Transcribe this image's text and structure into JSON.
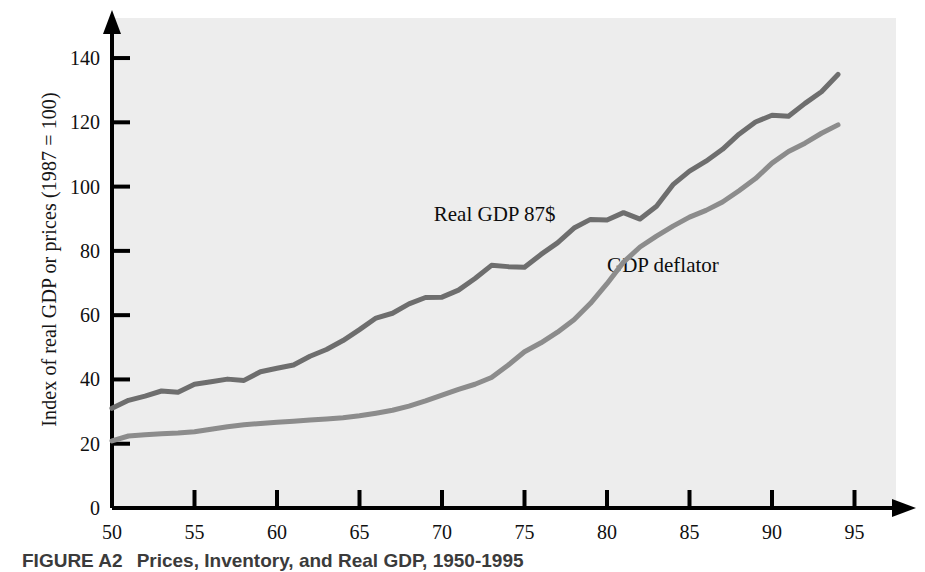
{
  "figure": {
    "caption_number": "FIGURE A2",
    "caption_text": "Prices, Inventory, and Real GDP, 1950-1995"
  },
  "chart_data": {
    "type": "line",
    "title": "",
    "xlabel": "",
    "ylabel": "Index of real GDP or prices (1987 = 100)",
    "xlim": [
      1950,
      1996
    ],
    "ylim": [
      0,
      148
    ],
    "grid": false,
    "legend_position": "inline-annotation",
    "xticks": [
      50,
      55,
      60,
      65,
      70,
      75,
      80,
      85,
      90,
      95
    ],
    "xtick_labels": [
      "50",
      "55",
      "60",
      "65",
      "70",
      "75",
      "80",
      "85",
      "90",
      "95"
    ],
    "yticks": [
      0,
      20,
      40,
      60,
      80,
      100,
      120,
      140
    ],
    "ytick_labels": [
      "0",
      "20",
      "40",
      "60",
      "80",
      "100",
      "120",
      "140"
    ],
    "x": [
      1950,
      1951,
      1952,
      1953,
      1954,
      1955,
      1956,
      1957,
      1958,
      1959,
      1960,
      1961,
      1962,
      1963,
      1964,
      1965,
      1966,
      1967,
      1968,
      1969,
      1970,
      1971,
      1972,
      1973,
      1974,
      1975,
      1976,
      1977,
      1978,
      1979,
      1980,
      1981,
      1982,
      1983,
      1984,
      1985,
      1986,
      1987,
      1988,
      1989,
      1990,
      1991,
      1992,
      1993,
      1994
    ],
    "series": [
      {
        "name": "Real GDP 87$",
        "color": "#6e6e6e",
        "label": "Real GDP 87$",
        "label_x": 1969.5,
        "label_y": 91,
        "values": [
          31.0,
          33.5,
          34.8,
          36.4,
          36.0,
          38.5,
          39.3,
          40.1,
          39.7,
          42.4,
          43.5,
          44.5,
          47.2,
          49.3,
          52.1,
          55.5,
          59.1,
          60.6,
          63.5,
          65.5,
          65.6,
          67.8,
          71.4,
          75.5,
          75.1,
          74.9,
          78.9,
          82.5,
          87.1,
          89.8,
          89.6,
          91.9,
          89.9,
          93.9,
          100.6,
          104.8,
          107.9,
          111.6,
          116.3,
          120.1,
          122.2,
          121.9,
          125.9,
          129.5,
          134.9
        ]
      },
      {
        "name": "GDP deflator",
        "color": "#8c8c8c",
        "label": "GDP deflator",
        "label_x": 1980.0,
        "label_y": 75,
        "values": [
          20.9,
          22.4,
          22.8,
          23.1,
          23.3,
          23.7,
          24.5,
          25.3,
          25.9,
          26.3,
          26.7,
          27.0,
          27.4,
          27.7,
          28.1,
          28.7,
          29.5,
          30.4,
          31.7,
          33.3,
          35.1,
          36.9,
          38.5,
          40.6,
          44.4,
          48.6,
          51.4,
          54.7,
          58.6,
          63.7,
          69.8,
          76.5,
          81.2,
          84.6,
          87.7,
          90.5,
          92.6,
          95.2,
          98.7,
          102.5,
          107.3,
          110.9,
          113.5,
          116.6,
          119.2
        ]
      }
    ]
  }
}
